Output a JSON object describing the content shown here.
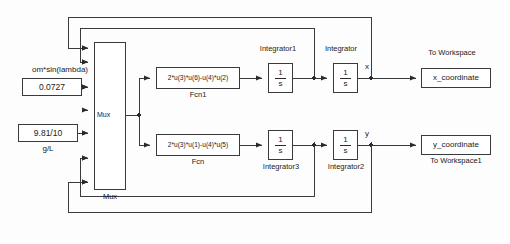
{
  "diagram": {
    "line_color": "#3a3a3a",
    "block_fill": "#ffffff",
    "text_color": "#1a1a1a"
  },
  "constants": [
    {
      "id": "om-sin-lambda",
      "caption": "om*sin(lambda)",
      "value": "0.0727"
    },
    {
      "id": "g-over-L",
      "value": "9.81/10",
      "caption": "g/L"
    }
  ],
  "mux": {
    "inside_label": "Mux",
    "below_label": "Mux",
    "input_count": 6
  },
  "fcn_blocks": [
    {
      "id": "fcn1",
      "expression": "2*u(3)*u(6)-u(4)*u(2)",
      "label": "Fcn1"
    },
    {
      "id": "fcn",
      "expression": "2*u(3)*u(1)-u(4)*u(5)",
      "label": "Fcn"
    }
  ],
  "integrators": [
    {
      "id": "integrator1",
      "label": "Integrator1",
      "numerator": "1",
      "denominator": "s",
      "label_position": "above"
    },
    {
      "id": "integrator",
      "label": "Integrator",
      "numerator": "1",
      "denominator": "s",
      "label_position": "above"
    },
    {
      "id": "integrator3",
      "label": "Integrator3",
      "numerator": "1",
      "denominator": "s",
      "label_position": "below"
    },
    {
      "id": "integrator2",
      "label": "Integrator2",
      "numerator": "1",
      "denominator": "s",
      "label_position": "below"
    }
  ],
  "signal_labels": [
    {
      "id": "signal-x",
      "text": "x"
    },
    {
      "id": "signal-y",
      "text": "y"
    }
  ],
  "sinks": [
    {
      "id": "x-workspace",
      "caption": "To Workspace",
      "value": "x_coordinate",
      "caption_position": "above"
    },
    {
      "id": "y-workspace",
      "value": "y_coordinate",
      "caption": "To Workspace1",
      "caption_position": "below"
    }
  ]
}
